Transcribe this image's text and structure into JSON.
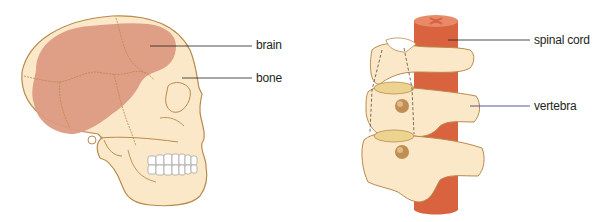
{
  "diagram": {
    "skull": {
      "labels": [
        {
          "id": "brain",
          "text": "brain"
        },
        {
          "id": "bone",
          "text": "bone"
        }
      ]
    },
    "spine": {
      "labels": [
        {
          "id": "spinal-cord",
          "text": "spinal cord"
        },
        {
          "id": "vertebra",
          "text": "vertebra"
        }
      ]
    }
  },
  "colors": {
    "bone": "#fbe8c8",
    "bone_outline": "#b98a4e",
    "brain": "#dd9a83",
    "spinal_cord": "#d9623f",
    "disc": "#ecd490",
    "teeth": "#ffffff",
    "leader_line": "#231f20",
    "leader_line_blue": "#2b2f8f"
  }
}
